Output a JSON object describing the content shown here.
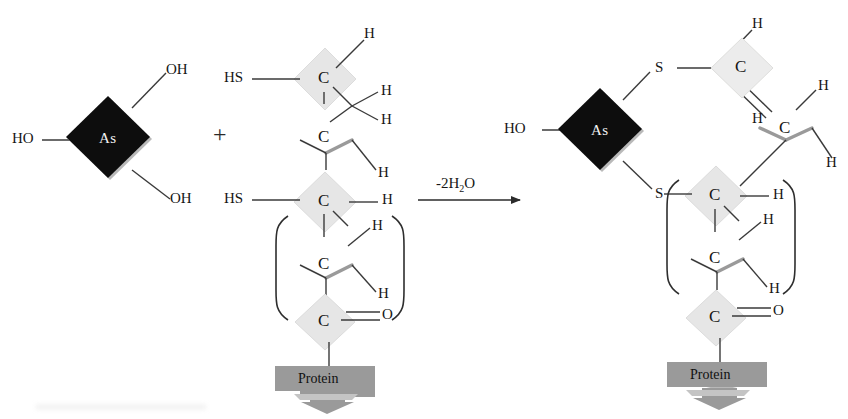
{
  "diagram": {
    "background": "#ffffff",
    "operator": "+",
    "reaction_label": "-2H",
    "reaction_label_sub": "2",
    "reaction_label_tail": "O",
    "reaction_label_full": "-2H2O",
    "colors": {
      "arsenic_diamond": "#0d0d0d",
      "arsenic_text": "#f2f2f2",
      "carbon_diamond": "#e6e6e6",
      "carbon_diamond_stroke": "#d2d2d2",
      "protein_box": "#9a9a9a",
      "protein_shadow": "#b8b8b8",
      "bond": "#3a3a3a",
      "text": "#161616"
    }
  },
  "reactant_arsenite": {
    "center_label": "As",
    "substituents": [
      {
        "label": "OH",
        "position": "upper-right"
      },
      {
        "label": "HO",
        "position": "left"
      },
      {
        "label": "OH",
        "position": "lower-right"
      }
    ]
  },
  "reactant_protein": {
    "thiol_top": "HS",
    "thiol_bottom": "HS",
    "carbons": [
      {
        "label": "C",
        "shaded": true,
        "hydrogens": [
          "H",
          "H",
          "H"
        ]
      },
      {
        "label": "C",
        "shaded": false,
        "hydrogens": [
          "H"
        ]
      },
      {
        "label": "C",
        "shaded": true,
        "hydrogens": [
          "H"
        ]
      },
      {
        "label": "C",
        "shaded": false,
        "hydrogens": [
          "H",
          "H"
        ]
      },
      {
        "label": "C",
        "shaded": true,
        "hydrogens": []
      }
    ],
    "carbonyl_oxygen": "O",
    "protein_label": "Protein",
    "bracket": {
      "open": "(",
      "close": ")"
    }
  },
  "product_complex": {
    "center_label": "As",
    "hydroxyl": "HO",
    "sulfurs": [
      "S",
      "S"
    ],
    "carbons": [
      {
        "label": "C",
        "shaded": true,
        "hydrogens": [
          "H",
          "H"
        ]
      },
      {
        "label": "C",
        "shaded": false,
        "hydrogens": [
          "H",
          "H"
        ]
      },
      {
        "label": "C",
        "shaded": true,
        "hydrogens": [
          "H"
        ]
      },
      {
        "label": "C",
        "shaded": false,
        "hydrogens": [
          "H"
        ]
      },
      {
        "label": "C",
        "shaded": true,
        "hydrogens": []
      }
    ],
    "carbonyl_oxygen": "O",
    "protein_label": "Protein",
    "bracket": {
      "open": "(",
      "close": ")"
    }
  },
  "labels": {
    "L_OH_top": "OH",
    "L_HO": "HO",
    "L_OH_bottom": "OH",
    "L_HS_top": "HS",
    "L_HS_bottom": "HS",
    "L_C1": "C",
    "L_C2": "C",
    "L_C3": "C",
    "L_C4": "C",
    "L_C5": "C",
    "L_H1": "H",
    "L_H2": "H",
    "L_H3": "H",
    "L_H4": "H",
    "L_H5": "H",
    "L_H6": "H",
    "L_H7": "H",
    "L_O": "O",
    "L_protein": "Protein",
    "R_HO": "HO",
    "R_S_top": "S",
    "R_S_bottom": "S",
    "R_C1": "C",
    "R_C2": "C",
    "R_C3": "C",
    "R_C4": "C",
    "R_C5": "C",
    "R_H1": "H",
    "R_H2": "H",
    "R_H3": "H",
    "R_H4": "H",
    "R_H5": "H",
    "R_H6": "H",
    "R_O": "O",
    "R_protein": "Protein",
    "As_left": "As",
    "As_right": "As"
  }
}
